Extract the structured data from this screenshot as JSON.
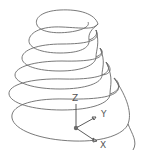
{
  "drawing": {
    "subject": "conical helix",
    "stroke_color": "#6a6a6a",
    "background": "#ffffff",
    "loops": [
      {
        "cx": 58,
        "cy": 22,
        "rx": 22,
        "ry": 12
      },
      {
        "cx": 58,
        "cy": 40,
        "rx": 30,
        "ry": 13
      },
      {
        "cx": 58,
        "cy": 57,
        "rx": 37,
        "ry": 14
      },
      {
        "cx": 58,
        "cy": 74,
        "rx": 43,
        "ry": 15
      },
      {
        "cx": 60,
        "cy": 93,
        "rx": 50,
        "ry": 16
      }
    ]
  },
  "ucs_icon": {
    "origin": [
      76,
      128
    ],
    "axes": {
      "z_label": "Z",
      "y_label": "Y",
      "x_label": "X"
    }
  }
}
